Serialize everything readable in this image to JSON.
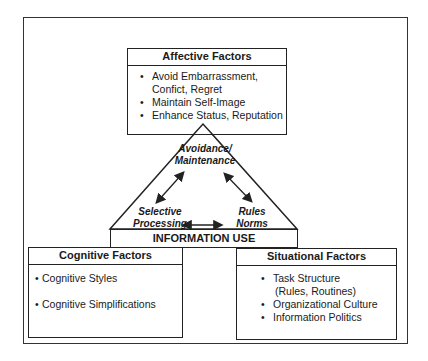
{
  "affective": {
    "title": "Affective Factors",
    "items": [
      "Avoid Embarrassment,",
      "Confict, Regret",
      "Maintain Self-Image",
      "Enhance Status, Reputation"
    ]
  },
  "triangle": {
    "top_label": [
      "Avoidance/",
      "Maintenance"
    ],
    "left_label": [
      "Selective",
      "Processing"
    ],
    "right_label": [
      "Rules",
      "Norms"
    ],
    "base_label": "INFORMATION USE"
  },
  "cognitive": {
    "title": "Cognitive Factors",
    "items": [
      "Cognitive Styles",
      "Cognitive Simplifications"
    ]
  },
  "situational": {
    "title": "Situational Factors",
    "items": [
      "Task Structure",
      "(Rules, Routines)",
      "Organizational Culture",
      "Information Politics"
    ]
  },
  "colors": {
    "line": "#222222",
    "background": "#ffffff"
  }
}
